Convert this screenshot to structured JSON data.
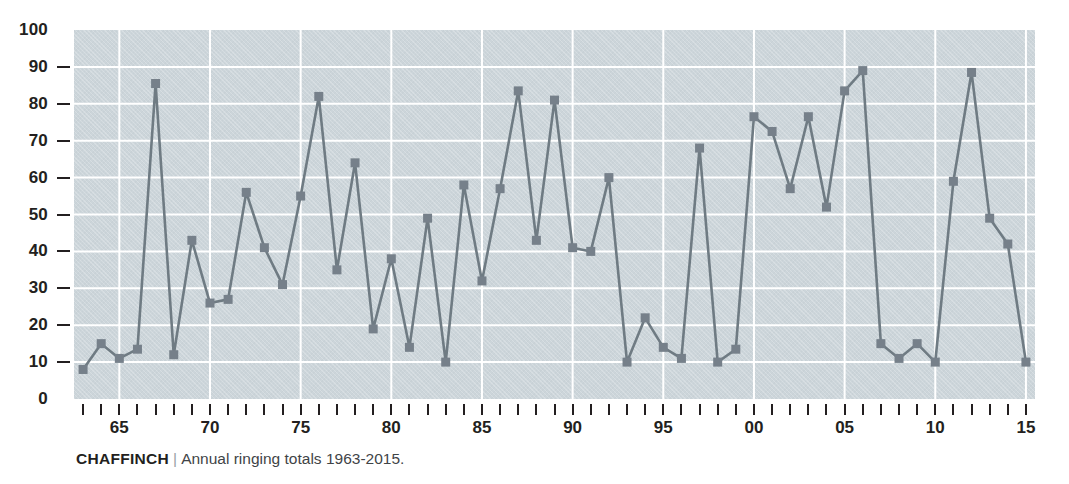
{
  "caption": {
    "species": "CHAFFINCH",
    "separator": "|",
    "description": "Annual ringing totals 1963-2015."
  },
  "colors": {
    "plot_background": "#ccd5da",
    "gridline": "#ffffff",
    "series_line": "#6f7b83",
    "marker": "#76808a",
    "axis_text": "#231f20",
    "caption_text": "#3f4447"
  },
  "chart_data": {
    "type": "line",
    "title": "",
    "subtitle": "",
    "xlabel": "",
    "ylabel": "",
    "ylim": [
      0,
      100
    ],
    "xlim": [
      1963,
      2015
    ],
    "ytick_step": 10,
    "yticks": [
      0,
      10,
      20,
      30,
      40,
      50,
      60,
      70,
      80,
      90,
      100
    ],
    "ytick_labels": [
      "0",
      "10",
      "20",
      "30",
      "40",
      "50",
      "60",
      "70",
      "80",
      "90",
      "100"
    ],
    "xtick_label_years": [
      1965,
      1970,
      1975,
      1980,
      1985,
      1990,
      1995,
      2000,
      2005,
      2010,
      2015
    ],
    "xtick_labels": [
      "65",
      "70",
      "75",
      "80",
      "85",
      "90",
      "95",
      "00",
      "05",
      "10",
      "15"
    ],
    "grid": {
      "horizontal": true,
      "vertical": true,
      "vertical_every_years": 5
    },
    "legend": null,
    "marker": "square",
    "x": [
      1963,
      1964,
      1965,
      1966,
      1967,
      1968,
      1969,
      1970,
      1971,
      1972,
      1973,
      1974,
      1975,
      1976,
      1977,
      1978,
      1979,
      1980,
      1981,
      1982,
      1983,
      1984,
      1985,
      1986,
      1987,
      1988,
      1989,
      1990,
      1991,
      1992,
      1993,
      1994,
      1995,
      1996,
      1997,
      1998,
      1999,
      2000,
      2001,
      2002,
      2003,
      2004,
      2005,
      2006,
      2007,
      2008,
      2009,
      2010,
      2011,
      2012,
      2013,
      2014,
      2015
    ],
    "values": [
      8,
      15,
      11,
      13.5,
      85.5,
      12,
      43,
      26,
      27,
      56,
      41,
      31,
      55,
      82,
      35,
      64,
      19,
      38,
      14,
      49,
      10,
      58,
      32,
      57,
      83.5,
      43,
      81,
      41,
      40,
      60,
      10,
      22,
      14,
      11,
      68,
      10,
      13.5,
      76.5,
      72.5,
      57,
      76.5,
      52,
      83.5,
      89,
      15,
      11,
      15,
      10,
      59,
      88.5,
      49,
      42,
      10
    ],
    "series": [
      {
        "name": "Annual ringing totals",
        "values": [
          8,
          15,
          11,
          13.5,
          85.5,
          12,
          43,
          26,
          27,
          56,
          41,
          31,
          55,
          82,
          35,
          64,
          19,
          38,
          14,
          49,
          10,
          58,
          32,
          57,
          83.5,
          43,
          81,
          41,
          40,
          60,
          10,
          22,
          14,
          11,
          68,
          10,
          13.5,
          76.5,
          72.5,
          57,
          76.5,
          52,
          83.5,
          89,
          15,
          11,
          15,
          10,
          59,
          88.5,
          49,
          42,
          10
        ]
      }
    ]
  }
}
